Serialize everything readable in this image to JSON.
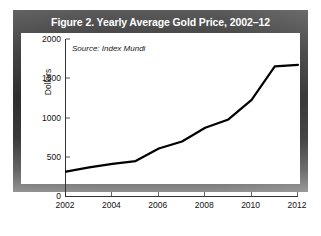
{
  "figure": {
    "title": "Figure 2. Yearly Average Gold Price, 2002–12",
    "source_note": "Source: Index Mundi",
    "frame_color": "#2b2b2b",
    "plot_background": "#ffffff",
    "line_color": "#000000"
  },
  "chart_data": {
    "type": "line",
    "title": "Figure 2. Yearly Average Gold Price, 2002–12",
    "subtitle": "",
    "annotations": [
      "Source: Index Mundi"
    ],
    "xlabel": "",
    "ylabel": "Dollars",
    "x": [
      2002,
      2003,
      2004,
      2005,
      2006,
      2007,
      2008,
      2009,
      2010,
      2011,
      2012
    ],
    "values": [
      310,
      365,
      410,
      445,
      605,
      695,
      870,
      975,
      1225,
      1650,
      1670
    ],
    "series": [
      {
        "name": "Yearly Average Gold Price",
        "values": [
          310,
          365,
          410,
          445,
          605,
          695,
          870,
          975,
          1225,
          1650,
          1670
        ]
      }
    ],
    "xlim": [
      2002,
      2012
    ],
    "ylim": [
      0,
      2000
    ],
    "xticks": [
      2002,
      2004,
      2006,
      2008,
      2010,
      2012
    ],
    "xticklabels": [
      "2002",
      "2004",
      "2006",
      "2008",
      "2010",
      "2012"
    ],
    "yticks": [
      0,
      500,
      1000,
      1500,
      2000
    ],
    "yticklabels": [
      "0",
      "500",
      "1000",
      "1500",
      "2000"
    ],
    "grid": false,
    "legend": null
  }
}
